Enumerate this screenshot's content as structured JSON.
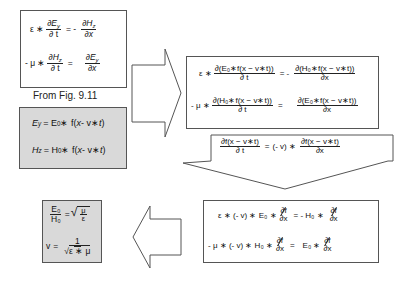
{
  "box1": {
    "eq1": {
      "lhs_coef": "ε ∗",
      "lhs_num": "∂E",
      "lhs_num_sub": "y",
      "lhs_den": "∂ t",
      "op": "= -",
      "rhs_num": "∂H",
      "rhs_num_sub": "z",
      "rhs_den": "∂x"
    },
    "eq2": {
      "lhs_coef": "- μ ∗",
      "lhs_num": "∂H",
      "lhs_num_sub": "z",
      "lhs_den": "∂ t",
      "op": "=",
      "rhs_num": "∂E",
      "rhs_num_sub": "y",
      "rhs_den": "∂x"
    }
  },
  "source_label": "From Fig. 9.11",
  "box2": {
    "eq1": {
      "lhs": "E",
      "lhs_sub": "y",
      "rhs_a": "= E",
      "rhs_sub": "0",
      "rhs_b": " ∗ f(",
      "var_x": "x",
      "mid": " - v∗",
      "var_t": "t",
      "end": ")"
    },
    "eq2": {
      "lhs": "H",
      "lhs_sub": "z",
      "rhs_a": "= H",
      "rhs_sub": "0",
      "rhs_b": " ∗ f(",
      "var_x": "x",
      "mid": " - v∗",
      "var_t": "t",
      "end": ")"
    }
  },
  "box3": {
    "eq1": {
      "lhs_coef": "ε ∗",
      "lhs_num": "∂(E₀∗f(x − v∗t))",
      "lhs_den": "∂ t",
      "op": "= -",
      "rhs_num": "∂(H₀∗f(x − v∗t))",
      "rhs_den": "∂x"
    },
    "eq2": {
      "lhs_coef": "- μ ∗",
      "lhs_num": "∂(H₀∗f(x − v∗t))",
      "lhs_den": "∂ t",
      "op": "=",
      "rhs_num": "∂(E₀∗f(x − v∗t))",
      "rhs_den": "∂x"
    }
  },
  "callout": {
    "lhs_num": "∂f(x − v∗t)",
    "lhs_den": "∂ t",
    "op": "=",
    "coef": "(- v) ∗",
    "rhs_num": "∂f(x − v∗t)",
    "rhs_den": "∂x"
  },
  "box4": {
    "eq1": {
      "lhs": "ε ∗ (- v) ∗ E₀ ∗",
      "frac_num": "∂f",
      "frac_den": "∂x",
      "op": "= - H₀ ∗",
      "rhs_num": "∂f",
      "rhs_den": "∂x"
    },
    "eq2": {
      "lhs": "- μ ∗ (- v) ∗ H₀ ∗",
      "frac_num": "∂f",
      "frac_den": "∂x",
      "op": "=",
      "rhs": "E₀ ∗",
      "rhs_num": "∂f",
      "rhs_den": "∂x"
    }
  },
  "box5": {
    "eq1": {
      "lhs_num": "E₀",
      "lhs_den": "H₀",
      "op": "=",
      "root_num": "μ",
      "root_den": "ε"
    },
    "eq2": {
      "lhs": "v",
      "op": "=",
      "num": "1",
      "root_den": "ε ∗ μ"
    }
  },
  "colors": {
    "gray_fill": "#d9d9d9",
    "border": "#555555",
    "arrow_stroke": "#555555"
  }
}
